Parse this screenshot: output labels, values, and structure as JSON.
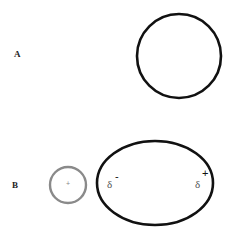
{
  "panels": [
    {
      "label": "A",
      "shape": "circle"
    },
    {
      "label": "B",
      "shapes": [
        "small gray circle with +",
        "ellipse"
      ]
    }
  ],
  "panel_b": {
    "small_circle_charge": "+",
    "left_partial": "δ",
    "left_sign": "-",
    "right_partial": "δ",
    "right_sign": "+"
  },
  "colors": {
    "outline": "#111111",
    "small_circle": "#8a8a8a",
    "background": "#ffffff"
  }
}
